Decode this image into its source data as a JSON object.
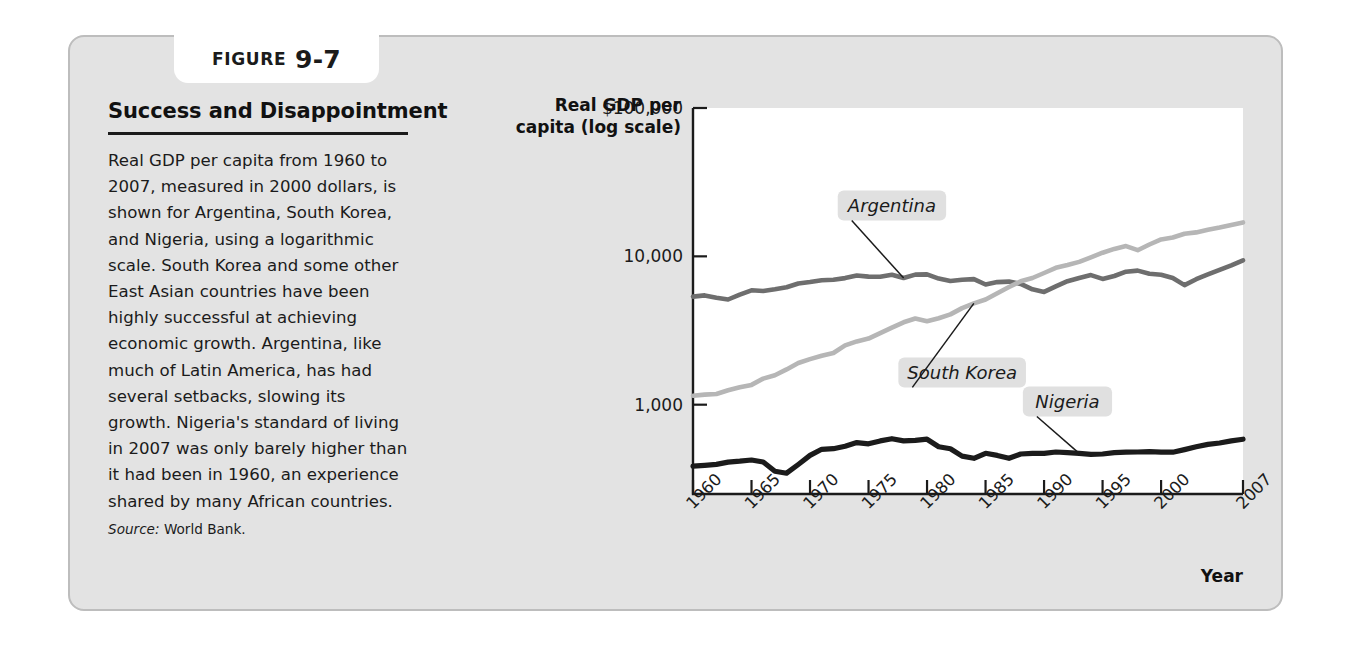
{
  "figure": {
    "tab_word": "FIGURE",
    "tab_number": "9-7",
    "title": "Success and Disappointment",
    "body": "Real GDP per capita from 1960 to 2007, measured in 2000 dollars, is shown for Argentina, South Korea, and Nigeria, using a logarithmic scale. South Korea and some other East Asian countries have been highly successful at achieving economic growth. Argentina, like much of Latin America, has had several setbacks, slowing its growth. Nigeria's standard of living in 2007 was only barely higher than it had been in 1960, an experience shared by many African countries.",
    "source_label": "Source:",
    "source_value": "World Bank.",
    "card_bg": "#e3e3e3",
    "card_border": "#bdbdbd"
  },
  "chart_data": {
    "type": "line",
    "title": "Success and Disappointment",
    "ylabel": "Real GDP per capita (log scale)",
    "xlabel": "Year",
    "y_scale": "log",
    "ylim": [
      250,
      100000
    ],
    "xlim": [
      1960,
      2007
    ],
    "grid": false,
    "legend_position": "inline-annotations",
    "ytick_labels": [
      "$100,000",
      "10,000",
      "1,000"
    ],
    "ytick_values": [
      100000,
      10000,
      1000
    ],
    "xtick_labels": [
      "1960",
      "1965",
      "1970",
      "1975",
      "1980",
      "1985",
      "1990",
      "1995",
      "2000",
      "2007"
    ],
    "xtick_values": [
      1960,
      1965,
      1970,
      1975,
      1980,
      1985,
      1990,
      1995,
      2000,
      2007
    ],
    "x": [
      1960,
      1961,
      1962,
      1963,
      1964,
      1965,
      1966,
      1967,
      1968,
      1969,
      1970,
      1971,
      1972,
      1973,
      1974,
      1975,
      1976,
      1977,
      1978,
      1979,
      1980,
      1981,
      1982,
      1983,
      1984,
      1985,
      1986,
      1987,
      1988,
      1989,
      1990,
      1991,
      1992,
      1993,
      1994,
      1995,
      1996,
      1997,
      1998,
      1999,
      2000,
      2001,
      2002,
      2003,
      2004,
      2005,
      2006,
      2007
    ],
    "series": [
      {
        "name": "Argentina",
        "color": "#6e6e6e",
        "label_x": 1977,
        "label_y": 22000,
        "values": [
          5350,
          5450,
          5260,
          5120,
          5520,
          5900,
          5840,
          6000,
          6180,
          6560,
          6720,
          6900,
          6950,
          7130,
          7430,
          7300,
          7290,
          7520,
          7140,
          7530,
          7560,
          7080,
          6820,
          6960,
          7020,
          6460,
          6700,
          6760,
          6520,
          6000,
          5760,
          6270,
          6800,
          7140,
          7470,
          7050,
          7370,
          7880,
          8010,
          7640,
          7510,
          7140,
          6400,
          7010,
          7560,
          8120,
          8700,
          9400
        ]
      },
      {
        "name": "South Korea",
        "color": "#b6b6b6",
        "label_x": 1983,
        "label_y": 1650,
        "values": [
          1150,
          1170,
          1180,
          1250,
          1310,
          1360,
          1500,
          1580,
          1730,
          1910,
          2030,
          2140,
          2230,
          2510,
          2670,
          2790,
          3040,
          3310,
          3590,
          3810,
          3650,
          3830,
          4060,
          4480,
          4820,
          5120,
          5640,
          6210,
          6790,
          7150,
          7720,
          8370,
          8740,
          9180,
          9850,
          10590,
          11220,
          11720,
          11000,
          12020,
          13000,
          13390,
          14220,
          14510,
          15100,
          15640,
          16290,
          16930
        ]
      },
      {
        "name": "Nigeria",
        "color": "#1b1b1b",
        "label_x": 1992,
        "label_y": 1050,
        "values": [
          385,
          390,
          396,
          410,
          416,
          424,
          411,
          356,
          345,
          395,
          455,
          500,
          505,
          525,
          555,
          545,
          570,
          590,
          570,
          575,
          585,
          520,
          505,
          450,
          435,
          470,
          455,
          435,
          465,
          470,
          470,
          480,
          475,
          470,
          463,
          465,
          475,
          478,
          480,
          482,
          478,
          478,
          498,
          520,
          540,
          552,
          570,
          585
        ]
      }
    ]
  }
}
